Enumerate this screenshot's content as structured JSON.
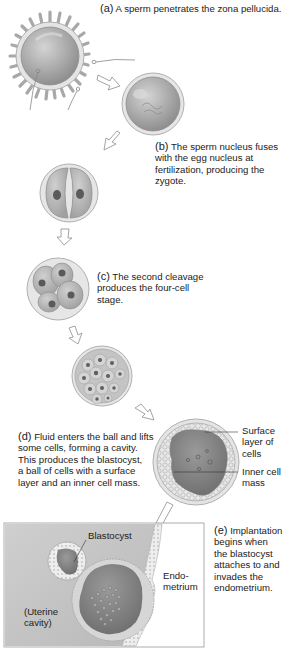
{
  "figure": {
    "steps": [
      {
        "id": "a",
        "label": "(a)",
        "text": "A sperm penetrates the zona pellucida."
      },
      {
        "id": "b",
        "label": "(b)",
        "text_lines": [
          "The sperm nucleus fuses",
          "with the egg nucleus at",
          "fertilization, producing the",
          "zygote."
        ]
      },
      {
        "id": "c",
        "label": "(c)",
        "text_lines": [
          "The second cleavage",
          "produces the four-cell",
          "stage."
        ]
      },
      {
        "id": "d",
        "label": "(d)",
        "text_lines": [
          "Fluid enters the ball and lifts",
          "some cells, forming a cavity.",
          "This produces the blastocyst,",
          "a ball of cells with a surface",
          "layer and an inner cell mass."
        ]
      },
      {
        "id": "e",
        "label": "(e)",
        "text_lines": [
          "Implantation",
          "begins when",
          "the blastocyst",
          "attaches to and",
          "invades the",
          "endometrium."
        ]
      }
    ],
    "callouts": {
      "surface_layer": [
        "Surface",
        "layer of",
        "cells"
      ],
      "inner_cell_mass": [
        "Inner cell",
        "mass"
      ],
      "blastocyst": "Blastocyst",
      "endometrium": [
        "Endo-",
        "metrium"
      ],
      "uterine_cavity": [
        "(Uterine",
        "cavity)"
      ]
    },
    "colors": {
      "cell_fill": "#b4b4b4",
      "cell_dark": "#8c8c8c",
      "zona": "#e6e6e6",
      "uterus_bg": "#c8c8c8",
      "outline": "#9a9a9a",
      "nucleus": "#5a5a5a"
    }
  }
}
